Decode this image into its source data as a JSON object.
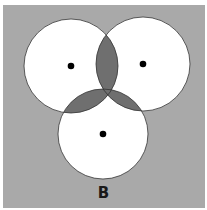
{
  "figure": {
    "label": "B",
    "background_color": "#a9a9a9",
    "circle_fill": "#ffffff",
    "overlap_fill": "#6f6f6f",
    "dot_color": "#000000",
    "circles": [
      {
        "name": "left",
        "cx": 71,
        "cy": 66,
        "r": 47
      },
      {
        "name": "right",
        "cx": 143,
        "cy": 64,
        "r": 47
      },
      {
        "name": "bottom",
        "cx": 103,
        "cy": 134,
        "r": 45
      }
    ]
  }
}
